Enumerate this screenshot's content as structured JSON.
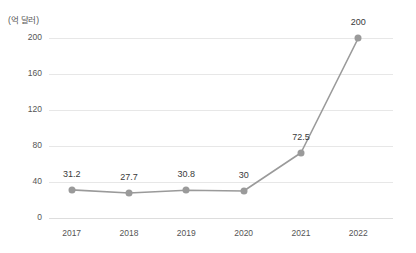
{
  "chart_data": {
    "type": "line",
    "title": "",
    "subtitle": "",
    "unit_label": "(억 달러)",
    "xlabel": "",
    "ylabel": "",
    "categories": [
      "2017",
      "2018",
      "2019",
      "2020",
      "2021",
      "2022"
    ],
    "values": [
      31.2,
      27.7,
      30.8,
      30,
      72.5,
      200
    ],
    "point_labels": [
      "31.2",
      "27.7",
      "30.8",
      "30",
      "72.5",
      "200"
    ],
    "ylim": [
      0,
      200
    ],
    "ytick_labels": [
      "0",
      "40",
      "80",
      "120",
      "160",
      "200"
    ],
    "ytick_values": [
      0,
      40,
      80,
      120,
      160,
      200
    ],
    "grid": "horizontal",
    "legend": "none",
    "series": [
      {
        "name": "",
        "values": [
          31.2,
          27.7,
          30.8,
          30,
          72.5,
          200
        ]
      }
    ],
    "colors": {
      "line": "#9a9a9a",
      "marker": "#9a9a9a",
      "grid": "#e7e7e7",
      "baseline": "#dddddd",
      "tick_text": "#555555",
      "label_text": "#3a3a3a",
      "background": "#ffffff"
    }
  }
}
